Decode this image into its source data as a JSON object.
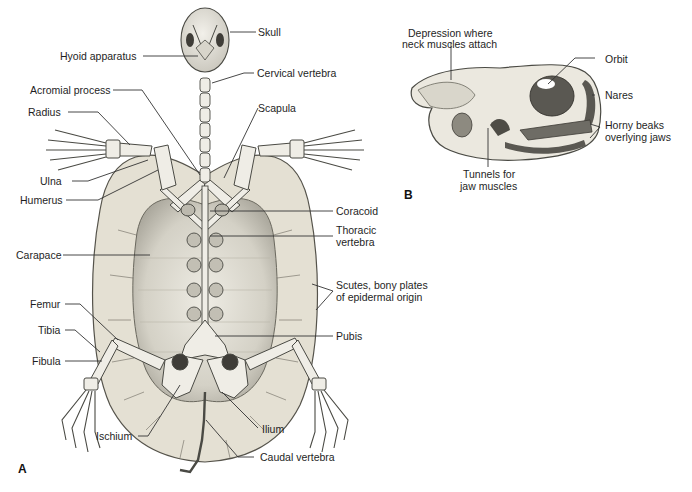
{
  "figure": {
    "panel_a": {
      "letter": "A",
      "labels": {
        "skull": "Skull",
        "hyoid": "Hyoid apparatus",
        "cervical": "Cervical vertebra",
        "acromial": "Acromial process",
        "radius": "Radius",
        "scapula": "Scapula",
        "ulna": "Ulna",
        "humerus": "Humerus",
        "coracoid": "Coracoid",
        "thoracic_1": "Thoracic",
        "thoracic_2": "vertebra",
        "carapace": "Carapace",
        "scutes_1": "Scutes, bony plates",
        "scutes_2": "of epidermal origin",
        "femur": "Femur",
        "tibia": "Tibia",
        "pubis": "Pubis",
        "fibula": "Fibula",
        "ilium": "Ilium",
        "ischium": "Ischium",
        "caudal": "Caudal vertebra"
      }
    },
    "panel_b": {
      "letter": "B",
      "labels": {
        "depression_1": "Depression where",
        "depression_2": "neck muscles attach",
        "orbit": "Orbit",
        "nares": "Nares",
        "horny_1": "Horny beaks",
        "horny_2": "overlying jaws",
        "tunnels_1": "Tunnels for",
        "tunnels_2": "jaw muscles"
      }
    },
    "colors": {
      "shell": "#e6e2d6",
      "shell_inner": "#d8d4c8",
      "bone": "#efede6",
      "bone_outline": "#4a4a44",
      "shadow": "#8c8a80",
      "leader": "#333333"
    }
  }
}
